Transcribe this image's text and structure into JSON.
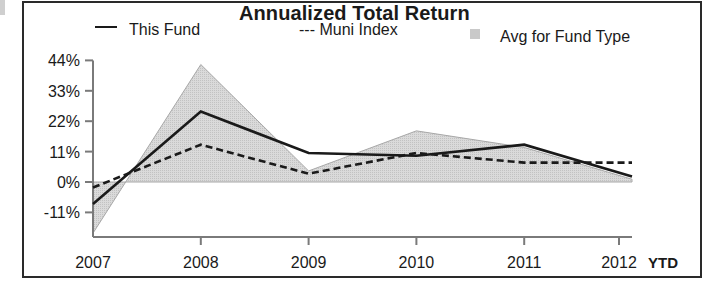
{
  "chart_data": {
    "type": "line",
    "title": "Annualized Total Return",
    "xlabel": "",
    "ylabel": "",
    "categories": [
      "2007",
      "2008",
      "2009",
      "2010",
      "2011",
      "2012"
    ],
    "x_suffix_label": "YTD",
    "yticks": [
      "44%",
      "33%",
      "22%",
      "11%",
      "0%",
      "-11%"
    ],
    "ytick_values": [
      44,
      33,
      22,
      11,
      0,
      -11
    ],
    "ylim": [
      -20,
      44
    ],
    "grid": false,
    "legend_position": "top",
    "series": [
      {
        "name": "This Fund",
        "style": "solid",
        "values": [
          -8,
          25.5,
          10.5,
          9.5,
          13.5,
          2
        ]
      },
      {
        "name": "Muni Index",
        "style": "dashed",
        "values": [
          -2,
          13.5,
          3,
          10.5,
          7,
          7
        ]
      },
      {
        "name": "Avg for Fund Type",
        "style": "area",
        "values": [
          -18.5,
          42.5,
          4,
          18.5,
          12.5,
          1
        ]
      }
    ]
  },
  "legend": {
    "fund_label": "This Fund",
    "muni_label": "--- Muni Index",
    "avg_label": "Avg for Fund Type"
  },
  "colors": {
    "line": "#1a1a1a",
    "area_fill": "#d9d9d9",
    "area_edge": "#a8a8a8",
    "axis": "#7a7a7a"
  }
}
